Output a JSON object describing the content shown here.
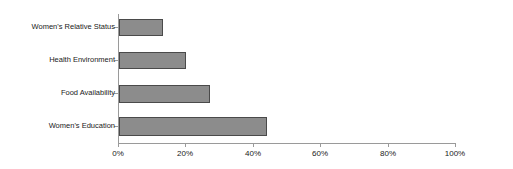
{
  "chart_data": {
    "type": "bar",
    "orientation": "horizontal",
    "title": "",
    "subtitle": "",
    "xlabel": "",
    "ylabel": "",
    "categories": [
      "Women's Relative Status",
      "Health Environment",
      "Food Availability",
      "Women's Education"
    ],
    "values": [
      13,
      20,
      27,
      44
    ],
    "value_suffix": "%",
    "xlim": [
      0,
      100
    ],
    "xticks": [
      0,
      20,
      40,
      60,
      80,
      100
    ],
    "xtick_labels": [
      "0%",
      "20%",
      "40%",
      "60%",
      "80%",
      "100%"
    ],
    "grid": false,
    "legend": null,
    "series": [
      {
        "name": "",
        "values": [
          13,
          20,
          27,
          44
        ]
      }
    ],
    "colors": {
      "bar_fill": "#8c8c8c",
      "bar_border": "#4a4a4a",
      "axis": "#9a9a9a",
      "text": "#1a1a1a",
      "background": "#ffffff"
    }
  }
}
